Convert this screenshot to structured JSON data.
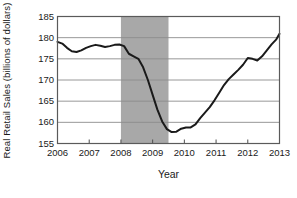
{
  "chart_data": {
    "type": "line",
    "title": "",
    "xlabel": "Year",
    "ylabel": "Real Retail Sales (billions of dollars)",
    "xlim": [
      2006,
      2013
    ],
    "ylim": [
      155,
      185
    ],
    "yticks": [
      185,
      180,
      175,
      170,
      165,
      160,
      155
    ],
    "xticks": [
      2006,
      2007,
      2008,
      2009,
      2010,
      2011,
      2012,
      2013
    ],
    "grid": "horizontal",
    "legend": "none",
    "line_color": "#1a1a1a",
    "shaded_region": {
      "label": "recession",
      "x_start": 2008.0,
      "x_end": 2009.5,
      "color": "#a8a8a8"
    },
    "series": [
      {
        "name": "Real Retail Sales",
        "x": [
          2006.0,
          2006.15,
          2006.3,
          2006.45,
          2006.6,
          2006.75,
          2006.9,
          2007.05,
          2007.2,
          2007.35,
          2007.5,
          2007.65,
          2007.8,
          2007.95,
          2008.1,
          2008.25,
          2008.4,
          2008.55,
          2008.7,
          2008.85,
          2009.0,
          2009.15,
          2009.3,
          2009.45,
          2009.6,
          2009.75,
          2009.9,
          2010.05,
          2010.2,
          2010.35,
          2010.5,
          2010.65,
          2010.8,
          2010.95,
          2011.1,
          2011.25,
          2011.4,
          2011.55,
          2011.7,
          2011.85,
          2012.0,
          2012.15,
          2012.3,
          2012.45,
          2012.6,
          2012.75,
          2012.9,
          2013.0
        ],
        "y": [
          179.0,
          178.6,
          177.6,
          176.8,
          176.6,
          177.0,
          177.6,
          178.0,
          178.3,
          178.1,
          177.8,
          178.0,
          178.3,
          178.4,
          178.0,
          176.2,
          175.6,
          175.0,
          173.0,
          170.0,
          166.5,
          163.0,
          160.2,
          158.4,
          157.7,
          157.8,
          158.5,
          158.8,
          158.8,
          159.5,
          161.0,
          162.3,
          163.6,
          165.2,
          167.0,
          168.8,
          170.2,
          171.3,
          172.4,
          173.6,
          175.2,
          175.0,
          174.6,
          175.6,
          177.0,
          178.4,
          179.6,
          180.9
        ]
      }
    ]
  },
  "axis": {
    "y_tick_labels": [
      "185",
      "180",
      "175",
      "170",
      "165",
      "160",
      "155"
    ],
    "x_tick_labels": [
      "2006",
      "2007",
      "2008",
      "2009",
      "2010",
      "2011",
      "2012",
      "2013"
    ],
    "y_axis_title": "Real Retail Sales (billions of dollars)",
    "x_axis_title": "Year"
  }
}
